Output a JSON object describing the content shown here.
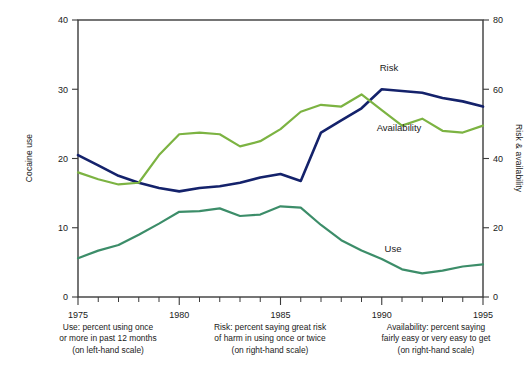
{
  "chart_data": {
    "type": "line",
    "title": "",
    "xlabel": "",
    "ylabel": "Cocaine use",
    "y2label": "Risk & availability",
    "xlim": [
      1975,
      1995
    ],
    "ylim": [
      0,
      40
    ],
    "y2lim": [
      0,
      80
    ],
    "grid": false,
    "legend": "inline-annotations",
    "x": [
      1975,
      1976,
      1977,
      1978,
      1979,
      1980,
      1981,
      1982,
      1983,
      1984,
      1985,
      1986,
      1987,
      1988,
      1989,
      1990,
      1991,
      1992,
      1993,
      1994,
      1995
    ],
    "xticks_major": [
      1975,
      1980,
      1985,
      1990,
      1995
    ],
    "xtick_labels": [
      "1975",
      "1980",
      "1985",
      "1990",
      "1995"
    ],
    "yticks_left": [
      0,
      10,
      20,
      30,
      40
    ],
    "ytick_labels_left": [
      "0",
      "10",
      "20",
      "30",
      "40"
    ],
    "yticks_right": [
      0,
      20,
      40,
      60,
      80
    ],
    "ytick_labels_right": [
      "0",
      "20",
      "40",
      "60",
      "80"
    ],
    "series": [
      {
        "name": "Use",
        "label": "Use",
        "axis": "left",
        "color": "#3c8d69",
        "values": [
          5.6,
          6.7,
          7.5,
          9.0,
          10.6,
          12.3,
          12.4,
          12.8,
          11.7,
          11.9,
          13.1,
          12.9,
          10.4,
          8.2,
          6.7,
          5.5,
          4.0,
          3.4,
          3.8,
          4.4,
          4.7
        ]
      },
      {
        "name": "Risk",
        "label": "Risk",
        "axis": "right",
        "color": "#14226b",
        "values": [
          41.0,
          38.0,
          35.0,
          33.0,
          31.5,
          30.5,
          31.5,
          32.0,
          33.0,
          34.5,
          35.5,
          33.5,
          47.5,
          51.0,
          54.5,
          60.0,
          59.5,
          59.0,
          57.5,
          56.5,
          55.0
        ]
      },
      {
        "name": "Availability",
        "label": "Availability",
        "axis": "right",
        "color": "#7cb342",
        "values": [
          36.0,
          34.0,
          32.5,
          33.0,
          41.0,
          47.0,
          47.5,
          47.0,
          43.5,
          45.0,
          48.5,
          53.5,
          55.5,
          55.0,
          58.5,
          54.0,
          49.5,
          51.5,
          48.0,
          47.5,
          49.5
        ]
      }
    ],
    "annotations": [
      {
        "text": "Risk",
        "x_px": 389,
        "y_px": 71
      },
      {
        "text": "Availability",
        "x_px": 399,
        "y_px": 131
      },
      {
        "text": "Use",
        "x_px": 393,
        "y_px": 252
      }
    ]
  },
  "captions": {
    "use": "Use: percent using once\nor more in past 12 months\n(on left-hand scale)",
    "risk": "Risk: percent saying great risk\nof harm in using once or twice\n(on right-hand scale)",
    "availability": "Availability: percent saying\nfairly easy or very easy to get\n(on right-hand scale)"
  }
}
